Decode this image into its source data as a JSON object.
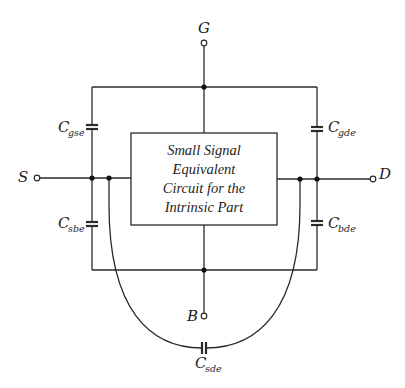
{
  "diagram": {
    "terminals": {
      "gate": "G",
      "source": "S",
      "drain": "D",
      "bulk": "B"
    },
    "box": {
      "lines": [
        "Small Signal",
        "Equivalent",
        "Circuit  for the",
        "Intrinsic   Part"
      ]
    },
    "capacitors": {
      "cgse": {
        "main": "C",
        "sub": "gse"
      },
      "cgde": {
        "main": "C",
        "sub": "gde"
      },
      "csbe": {
        "main": "C",
        "sub": "sbe"
      },
      "cbde": {
        "main": "C",
        "sub": "bde"
      },
      "csde": {
        "main": "C",
        "sub": "sde"
      }
    },
    "colors": {
      "line": "#2a2a2a",
      "background": "#ffffff"
    }
  }
}
